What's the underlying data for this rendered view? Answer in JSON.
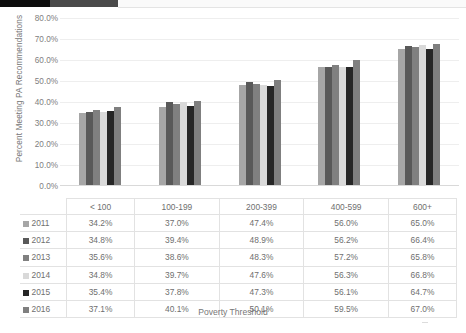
{
  "chart_data": {
    "type": "bar",
    "title": "",
    "subtitle": "",
    "xlabel": "Poverty Threshold",
    "ylabel": "Percent Meeting PA Recommendations",
    "categories": [
      "< 100",
      "100-199",
      "200-399",
      "400-599",
      "600+"
    ],
    "ytick_labels": [
      "0.0%",
      "10.0%",
      "20.0%",
      "30.0%",
      "40.0%",
      "50.0%",
      "60.0%",
      "70.0%",
      "80.0%"
    ],
    "ytick_values": [
      0,
      10,
      20,
      30,
      40,
      50,
      60,
      70,
      80
    ],
    "ylim": [
      0,
      80
    ],
    "grid": true,
    "legend_position": "table-below",
    "series": [
      {
        "name": "2011",
        "color": "#a6a6a6",
        "values": [
          34.2,
          37.0,
          47.4,
          56.0,
          65.0
        ],
        "labels": [
          "34.2%",
          "37.0%",
          "47.4%",
          "56.0%",
          "65.0%"
        ]
      },
      {
        "name": "2012",
        "color": "#595959",
        "values": [
          34.8,
          39.4,
          48.9,
          56.2,
          66.4
        ],
        "labels": [
          "34.8%",
          "39.4%",
          "48.9%",
          "56.2%",
          "66.4%"
        ]
      },
      {
        "name": "2013",
        "color": "#808080",
        "values": [
          35.6,
          38.6,
          48.3,
          57.2,
          65.8
        ],
        "labels": [
          "35.6%",
          "38.6%",
          "48.3%",
          "57.2%",
          "65.8%"
        ]
      },
      {
        "name": "2014",
        "color": "#d9d9d9",
        "values": [
          34.8,
          39.7,
          47.6,
          56.3,
          66.8
        ],
        "labels": [
          "34.8%",
          "39.7%",
          "47.6%",
          "56.3%",
          "66.8%"
        ]
      },
      {
        "name": "2015",
        "color": "#262626",
        "values": [
          35.4,
          37.8,
          47.3,
          56.1,
          64.7
        ],
        "labels": [
          "35.4%",
          "37.8%",
          "47.3%",
          "56.1%",
          "64.7%"
        ]
      },
      {
        "name": "2016",
        "color": "#7f7f7f",
        "values": [
          37.1,
          40.1,
          50.1,
          59.5,
          67.0
        ],
        "labels": [
          "37.1%",
          "40.1%",
          "50.1%",
          "59.5%",
          "67.0%"
        ]
      }
    ]
  },
  "table": {
    "corner_label": "",
    "column_headers": [
      "< 100",
      "100-199",
      "200-399",
      "400-599",
      "600+"
    ],
    "rows": [
      {
        "label": "2011",
        "color": "#a6a6a6",
        "cells": [
          "34.2%",
          "37.0%",
          "47.4%",
          "56.0%",
          "65.0%"
        ]
      },
      {
        "label": "2012",
        "color": "#595959",
        "cells": [
          "34.8%",
          "39.4%",
          "48.9%",
          "56.2%",
          "66.4%"
        ]
      },
      {
        "label": "2013",
        "color": "#808080",
        "cells": [
          "35.6%",
          "38.6%",
          "48.3%",
          "57.2%",
          "65.8%"
        ]
      },
      {
        "label": "2014",
        "color": "#d9d9d9",
        "cells": [
          "34.8%",
          "39.7%",
          "47.6%",
          "56.3%",
          "66.8%"
        ]
      },
      {
        "label": "2015",
        "color": "#262626",
        "cells": [
          "35.4%",
          "37.8%",
          "47.3%",
          "56.1%",
          "64.7%"
        ]
      },
      {
        "label": "2016",
        "color": "#7f7f7f",
        "cells": [
          "37.1%",
          "40.1%",
          "50.1%",
          "59.5%",
          "67.0%"
        ]
      }
    ]
  },
  "theme": {
    "topbar_black": "#0d0d0d",
    "topbar_gray": "#4a4a4a",
    "gridline": "#eeeeee",
    "border": "#e2e2e2",
    "text": "#6f6f6f"
  }
}
